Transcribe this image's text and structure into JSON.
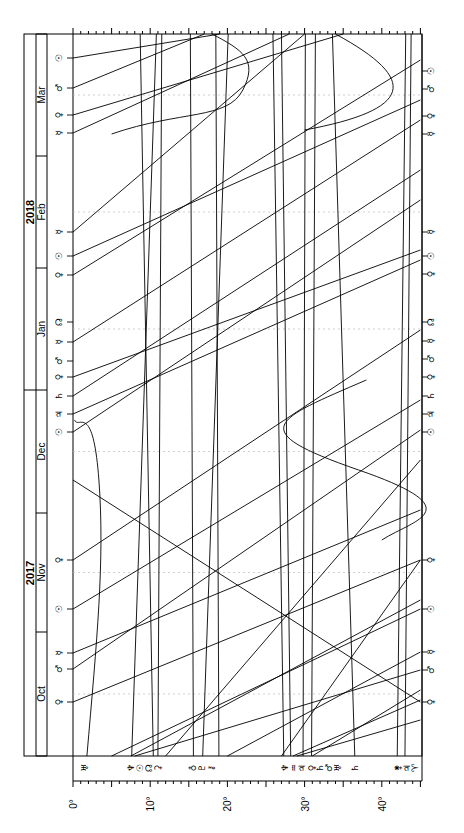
{
  "chart_data": {
    "type": "line",
    "orientation": "rotated-90 (time runs bottom-to-top, degrees run left-to-right)",
    "xlabel": "Degrees",
    "ylabel": "Date",
    "x_ticks": [
      "0°",
      "10°",
      "20°",
      "30°",
      "40°"
    ],
    "x_range": [
      0,
      45
    ],
    "years": [
      {
        "label": "2017",
        "pos": 0.72
      },
      {
        "label": "2018",
        "pos": 0.25
      }
    ],
    "months": [
      "Oct",
      "Nov",
      "Dec",
      "Jan",
      "Feb",
      "Mar"
    ],
    "month_bounds_y": [
      756,
      632,
      513,
      390,
      268,
      156,
      34
    ],
    "grid": "dotted horizontal lines at mid-month",
    "bottom_labels": [
      {
        "glyph": "♅",
        "name": "Uranus",
        "deg": 1.5
      },
      {
        "glyph": "♆",
        "name": "Pluto",
        "deg": 7.5
      },
      {
        "glyph": "☉",
        "name": "Sun",
        "deg": 8.7
      },
      {
        "glyph": "☊",
        "name": "Node",
        "deg": 9.9
      },
      {
        "glyph": "⚳",
        "name": "Ceres",
        "deg": 11.0
      },
      {
        "glyph": "♁",
        "name": "Earth",
        "deg": 15.6
      },
      {
        "glyph": "♇",
        "name": "Pluto2",
        "deg": 16.7
      },
      {
        "glyph": "⚷",
        "name": "Chiron",
        "deg": 17.9
      },
      {
        "glyph": "♆",
        "name": "Neptune",
        "deg": 27.4
      },
      {
        "glyph": "♒",
        "name": "Midpoint",
        "deg": 28.6
      },
      {
        "glyph": "♃",
        "name": "Jupiter",
        "deg": 29.7
      },
      {
        "glyph": "♀",
        "name": "Venus",
        "deg": 30.9
      },
      {
        "glyph": "♄",
        "name": "Saturn",
        "deg": 32.0
      },
      {
        "glyph": "♂",
        "name": "Mars",
        "deg": 33.1
      },
      {
        "glyph": "♅",
        "name": "Uranus2",
        "deg": 34.3
      },
      {
        "glyph": "♄",
        "name": "Saturn2",
        "deg": 36.5
      },
      {
        "glyph": "⚵",
        "name": "Asteroid",
        "deg": 42.1
      },
      {
        "glyph": "♃",
        "name": "Jupiter2",
        "deg": 43.2
      },
      {
        "glyph": "♈",
        "name": "Aries",
        "deg": 44.3
      }
    ],
    "left_events": [
      {
        "glyph": "☉",
        "y": 58
      },
      {
        "glyph": "♂",
        "y": 88
      },
      {
        "glyph": "♀",
        "y": 115
      },
      {
        "glyph": "☿",
        "y": 133
      },
      {
        "glyph": "☿",
        "y": 232
      },
      {
        "glyph": "☉",
        "y": 256
      },
      {
        "glyph": "♀",
        "y": 275
      },
      {
        "glyph": "☊",
        "y": 322
      },
      {
        "glyph": "☿",
        "y": 342
      },
      {
        "glyph": "♂",
        "y": 361
      },
      {
        "glyph": "♀",
        "y": 377
      },
      {
        "glyph": "♄",
        "y": 396
      },
      {
        "glyph": "♃",
        "y": 414
      },
      {
        "glyph": "☉",
        "y": 432
      },
      {
        "glyph": "♀",
        "y": 560
      },
      {
        "glyph": "☉",
        "y": 609
      },
      {
        "glyph": "☿",
        "y": 653
      },
      {
        "glyph": "♂",
        "y": 669
      },
      {
        "glyph": "♀",
        "y": 702
      }
    ],
    "right_events": [
      {
        "glyph": "☉",
        "y": 71
      },
      {
        "glyph": "♂",
        "y": 89
      },
      {
        "glyph": "♀",
        "y": 116
      },
      {
        "glyph": "☿",
        "y": 134
      },
      {
        "glyph": "☿",
        "y": 232
      },
      {
        "glyph": "☉",
        "y": 256
      },
      {
        "glyph": "♀",
        "y": 274
      },
      {
        "glyph": "☊",
        "y": 322
      },
      {
        "glyph": "☿",
        "y": 341
      },
      {
        "glyph": "♂",
        "y": 359
      },
      {
        "glyph": "♀",
        "y": 377
      },
      {
        "glyph": "♄",
        "y": 396
      },
      {
        "glyph": "♃",
        "y": 414
      },
      {
        "glyph": "☉",
        "y": 432
      },
      {
        "glyph": "♀",
        "y": 560
      },
      {
        "glyph": "☉",
        "y": 609
      },
      {
        "glyph": "☿",
        "y": 652
      },
      {
        "glyph": "♂",
        "y": 670
      },
      {
        "glyph": "♀",
        "y": 702
      }
    ],
    "series_vertical": [
      {
        "name": "Uranus",
        "deg_bottom": 1.8,
        "deg_top": 0.2,
        "shape": "wavy"
      },
      {
        "name": "Pluto",
        "deg_bottom": 7.6,
        "deg_top": 10.8
      },
      {
        "name": "Node",
        "deg_bottom": 10.4,
        "deg_top": 8.7
      },
      {
        "name": "Ceres",
        "deg_bottom": 11.0,
        "deg_top": 11.5
      },
      {
        "name": "Earth",
        "deg_bottom": 15.6,
        "deg_top": 15.2
      },
      {
        "name": "Pluto2",
        "deg_bottom": 16.8,
        "deg_top": 20.1
      },
      {
        "name": "Chiron",
        "deg_bottom": 18.9,
        "deg_top": 18.5
      },
      {
        "name": "Neptune",
        "deg_bottom": 27.3,
        "deg_top": 25.9
      },
      {
        "name": "Jupiter",
        "deg_bottom": 29.8,
        "deg_top": 30.1
      },
      {
        "name": "Venus",
        "deg_bottom": 30.9,
        "deg_top": 31.4
      },
      {
        "name": "Saturn2",
        "deg_bottom": 36.5,
        "deg_top": 33.6
      },
      {
        "name": "Asteroid",
        "deg_bottom": 42.0,
        "deg_top": 43.1
      },
      {
        "name": "Jupiter2",
        "deg_bottom": 43.0,
        "deg_top": 43.8
      }
    ]
  },
  "ui": {
    "axis_labels": [
      "0°",
      "10°",
      "20°",
      "30°",
      "40°"
    ],
    "year_labels": [
      "2017",
      "2018"
    ],
    "month_labels": [
      "Oct",
      "Nov",
      "Dec",
      "Jan",
      "Feb",
      "Mar"
    ]
  }
}
